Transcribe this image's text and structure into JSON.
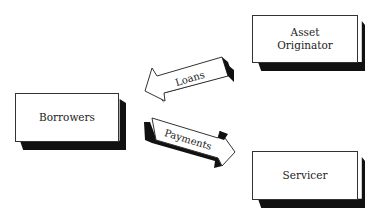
{
  "diagram": {
    "nodes": [
      {
        "id": "asset-originator",
        "label_line1": "Asset",
        "label_line2": "Originator"
      },
      {
        "id": "borrowers",
        "label": "Borrowers"
      },
      {
        "id": "servicer",
        "label": "Servicer"
      }
    ],
    "edges": [
      {
        "id": "loans",
        "label": "Loans",
        "from": "Asset Originator",
        "to": "Borrowers"
      },
      {
        "id": "payments",
        "label": "Payments",
        "from": "Borrowers",
        "to": "Servicer"
      }
    ],
    "colors": {
      "box_fill": "#ffffff",
      "shadow": "#111111",
      "stroke": "#333333"
    }
  }
}
